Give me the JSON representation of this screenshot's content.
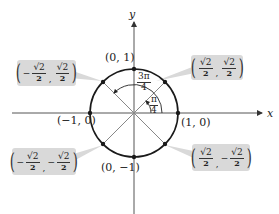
{
  "diagram": {
    "axes": {
      "x_label": "x",
      "y_label": "y"
    },
    "circle": {
      "center_px": [
        134,
        113
      ],
      "radius_px": 44,
      "color": "#1a1a1a"
    },
    "colors": {
      "axis": "#555555",
      "diagonal": "#888888",
      "callout_bg": "#d9d9d9",
      "text": "#222222"
    },
    "axis_points": [
      {
        "id": "top",
        "label": "(0, 1)"
      },
      {
        "id": "right",
        "label": "(1, 0)"
      },
      {
        "id": "left",
        "label": "(−1, 0)"
      },
      {
        "id": "bottom",
        "label": "(0, −1)"
      }
    ],
    "callouts": [
      {
        "id": "q1",
        "x_sign": "",
        "x_num": "√2",
        "x_den": "2",
        "y_sign": "",
        "y_num": "√2",
        "y_den": "2",
        "comma": ","
      },
      {
        "id": "q2",
        "x_sign": "−",
        "x_num": "√2",
        "x_den": "2",
        "y_sign": "",
        "y_num": "√2",
        "y_den": "2",
        "comma": ","
      },
      {
        "id": "q3",
        "x_sign": "−",
        "x_num": "√2",
        "x_den": "2",
        "y_sign": "−",
        "y_num": "√2",
        "y_den": "2",
        "comma": ","
      },
      {
        "id": "q4",
        "x_sign": "",
        "x_num": "√2",
        "x_den": "2",
        "y_sign": "−",
        "y_num": "√2",
        "y_den": "2",
        "comma": ","
      }
    ],
    "angles": [
      {
        "id": "pi-over-4",
        "num": "π",
        "den": "4"
      },
      {
        "id": "three-pi-over-4",
        "num": "3π",
        "den": "4"
      }
    ],
    "parens": {
      "open": "(",
      "close": ")"
    }
  }
}
